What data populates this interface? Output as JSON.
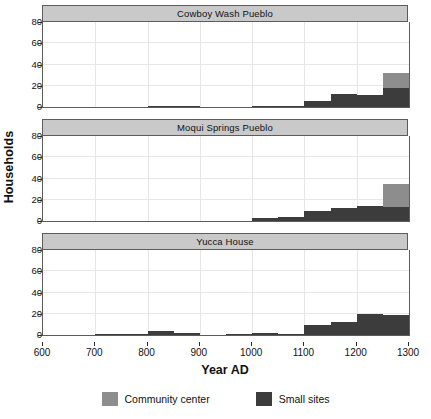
{
  "figure": {
    "ylabel": "Households",
    "xlabel": "Year AD"
  },
  "legend": {
    "items": [
      {
        "label": "Community center",
        "color": "#8d8d8d",
        "key": "community_center"
      },
      {
        "label": "Small sites",
        "color": "#3c3c3c",
        "key": "small_sites"
      }
    ]
  },
  "yaxis": {
    "ticks": [
      "0",
      "20",
      "40",
      "60",
      "80"
    ],
    "min": 0,
    "max": 80
  },
  "xaxis": {
    "ticks": [
      "600",
      "700",
      "800",
      "900",
      "1000",
      "1100",
      "1200",
      "1300"
    ],
    "min": 600,
    "max": 1300
  },
  "panels": [
    {
      "title": "Cowboy Wash Pueblo"
    },
    {
      "title": "Moqui Springs Pueblo"
    },
    {
      "title": "Yucca House"
    }
  ],
  "chart_data": {
    "type": "bar",
    "subtype": "stacked-histogram-small-multiples",
    "title": "",
    "xlabel": "Year AD",
    "ylabel": "Households",
    "xlim": [
      600,
      1300
    ],
    "ylim": [
      0,
      80
    ],
    "grid": true,
    "legend_position": "bottom-center",
    "bin_width": 50,
    "bin_starts": [
      600,
      650,
      700,
      750,
      800,
      850,
      900,
      950,
      1000,
      1050,
      1100,
      1150,
      1200,
      1250
    ],
    "series_names": [
      "Small sites",
      "Community center"
    ],
    "panels": [
      {
        "name": "Cowboy Wash Pueblo",
        "series": [
          {
            "name": "Small sites",
            "color": "#3c3c3c",
            "values": [
              0,
              0,
              0,
              0,
              1,
              1,
              0,
              0,
              1,
              1,
              6,
              12,
              11,
              18,
              17
            ]
          },
          {
            "name": "Community center",
            "color": "#8d8d8d",
            "values": [
              0,
              0,
              0,
              0,
              0,
              0,
              0,
              0,
              0,
              0,
              0,
              0,
              0,
              14,
              10
            ]
          }
        ],
        "totals": [
          0,
          0,
          0,
          0,
          1,
          1,
          0,
          0,
          1,
          1,
          6,
          12,
          11,
          32,
          27
        ]
      },
      {
        "name": "Moqui Springs Pueblo",
        "series": [
          {
            "name": "Small sites",
            "color": "#3c3c3c",
            "values": [
              0,
              0,
              0,
              0,
              0,
              0,
              0,
              0,
              3,
              4,
              9,
              12,
              14,
              13,
              12
            ]
          },
          {
            "name": "Community center",
            "color": "#8d8d8d",
            "values": [
              0,
              0,
              0,
              0,
              0,
              0,
              0,
              0,
              0,
              0,
              0,
              0,
              0,
              22,
              20
            ]
          }
        ],
        "totals": [
          0,
          0,
          0,
          0,
          0,
          0,
          0,
          0,
          3,
          4,
          9,
          12,
          14,
          35,
          32
        ]
      },
      {
        "name": "Yucca House",
        "series": [
          {
            "name": "Small sites",
            "color": "#3c3c3c",
            "values": [
              0,
              0,
              1,
              1,
              4,
              2,
              0,
              1,
              2,
              1,
              9,
              12,
              20,
              19,
              14
            ]
          },
          {
            "name": "Community center",
            "color": "#8d8d8d",
            "values": [
              0,
              0,
              0,
              0,
              0,
              0,
              0,
              0,
              0,
              0,
              0,
              0,
              0,
              0,
              62
            ]
          }
        ],
        "totals": [
          0,
          0,
          1,
          1,
          4,
          2,
          0,
          1,
          2,
          1,
          9,
          12,
          20,
          19,
          76
        ]
      }
    ]
  }
}
